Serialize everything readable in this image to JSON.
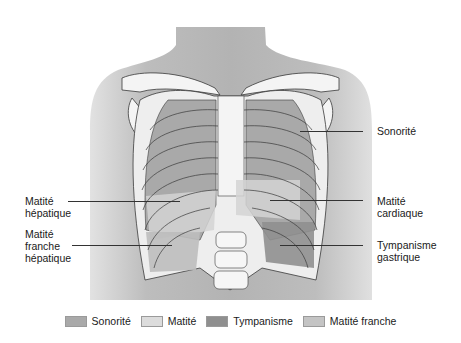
{
  "figure": {
    "colors": {
      "skin": "#b8b8b8",
      "skin_light": "#d6d6d6",
      "bone": "#f4f4f4",
      "bone_outline": "#3a3a3a",
      "sonorite": "#a9a9a9",
      "matite": "#dcdcdc",
      "tympanisme": "#8f8f8f",
      "matite_franche": "#c4c4c4"
    }
  },
  "labels": {
    "sonorite": "Sonorité",
    "matite_hepatique": "Matité\nhépatique",
    "matite_franche_hepatique": "Matité\nfranche\nhépatique",
    "matite_cardiaque": "Matité\ncardiaque",
    "tympanisme_gastrique": "Tympanisme\ngastrique"
  },
  "legend": [
    {
      "label": "Sonorité",
      "color": "#a9a9a9"
    },
    {
      "label": "Matité",
      "color": "#dcdcdc"
    },
    {
      "label": "Tympanisme",
      "color": "#8f8f8f"
    },
    {
      "label": "Matité franche",
      "color": "#c4c4c4"
    }
  ]
}
